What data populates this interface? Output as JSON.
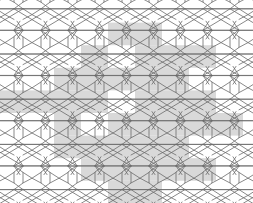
{
  "figure": {
    "width": 253,
    "height": 203,
    "background_color": "#ffffff",
    "stroke_color": "#6b6b6b",
    "stroke_width": 0.8,
    "shade_color": "#d2d2d2",
    "shade_opacity": 0.85
  },
  "lattice": {
    "period_x": 54,
    "period_y": 45.2,
    "origin_x": -14,
    "origin_y": -17,
    "columns": 6,
    "rows": 6,
    "description": "periodic tiling of elongated hexagons, bowtie/hourglass motifs and chevron zigzag fillers"
  },
  "motif": {
    "name": "hexagon-bowtie-chevron-unit",
    "parts": [
      {
        "name": "elongated-hexagon",
        "points": "10,2 28,2 37,8.6 37,19.2 28,25.8 10,25.8 1,19.2 1,8.6"
      },
      {
        "name": "bowtie-left-triangle",
        "points": "1,25.8 19,36.6 1,47.4"
      },
      {
        "name": "bowtie-right-triangle",
        "points": "37,25.8 19,36.6 37,47.4"
      },
      {
        "name": "bowtie-top-edge",
        "points": "1,25.8 37,25.8"
      },
      {
        "name": "bowtie-bottom-edge",
        "points": "1,47.4 37,47.4"
      },
      {
        "name": "left-chevron",
        "points": "1,8.6 -8,14.4 1,19.2"
      },
      {
        "name": "left-chevron-lower",
        "points": "1,25.8 -8,31.6 1,36.4"
      },
      {
        "name": "right-chevron",
        "points": "37,8.6 46,14.4 37,19.2"
      },
      {
        "name": "right-chevron-lower",
        "points": "37,25.8 46,31.6 37,36.4"
      },
      {
        "name": "upper-left-spur",
        "points": "10,2 4,-7"
      },
      {
        "name": "upper-right-spur",
        "points": "28,2 34,-7"
      },
      {
        "name": "lower-left-spur",
        "points": "10,47.4 4,56"
      },
      {
        "name": "lower-right-spur",
        "points": "28,47.4 34,56"
      }
    ]
  },
  "shading": {
    "cell_width": 27,
    "cell_height": 22.6,
    "note": "light gray square patches overlaid on the tiling, coordinates are column/row indices of a half-period grid",
    "cells": [
      {
        "col": 4,
        "row": 1
      },
      {
        "col": 5,
        "row": 1
      },
      {
        "col": 5,
        "row": 2
      },
      {
        "col": 6,
        "row": 2
      },
      {
        "col": 3,
        "row": 2
      },
      {
        "col": 2,
        "row": 3
      },
      {
        "col": 3,
        "row": 3
      },
      {
        "col": 4,
        "row": 3
      },
      {
        "col": 5,
        "row": 3
      },
      {
        "col": 6,
        "row": 3
      },
      {
        "col": 2,
        "row": 4
      },
      {
        "col": 3,
        "row": 4
      },
      {
        "col": 5,
        "row": 4
      },
      {
        "col": 6,
        "row": 4
      },
      {
        "col": 7,
        "row": 4
      },
      {
        "col": 1,
        "row": 4
      },
      {
        "col": 2,
        "row": 5
      },
      {
        "col": 4,
        "row": 5
      },
      {
        "col": 5,
        "row": 5
      },
      {
        "col": 6,
        "row": 5
      },
      {
        "col": 7,
        "row": 5
      },
      {
        "col": 3,
        "row": 6
      },
      {
        "col": 4,
        "row": 6
      },
      {
        "col": 5,
        "row": 6
      },
      {
        "col": 6,
        "row": 6
      },
      {
        "col": 8,
        "row": 5
      },
      {
        "col": 3,
        "row": 7
      },
      {
        "col": 4,
        "row": 7
      },
      {
        "col": 5,
        "row": 7
      },
      {
        "col": 6,
        "row": 7
      },
      {
        "col": 4,
        "row": 8
      },
      {
        "col": 5,
        "row": 8
      },
      {
        "col": 7,
        "row": 7
      },
      {
        "col": 0,
        "row": 4
      },
      {
        "col": 2,
        "row": 6
      },
      {
        "col": 7,
        "row": 2
      }
    ]
  }
}
